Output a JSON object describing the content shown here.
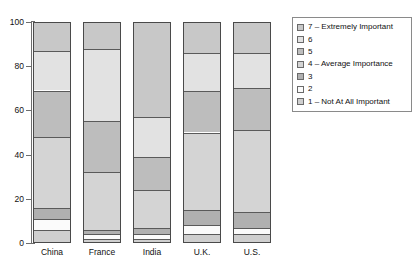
{
  "chart_data": {
    "type": "bar",
    "subtype": "stacked-percentage",
    "title": "",
    "xlabel": "",
    "ylabel": "",
    "ylim": [
      0,
      100
    ],
    "yticks": [
      0,
      20,
      40,
      60,
      80,
      100
    ],
    "ytick_labels": [
      "0",
      "20",
      "40",
      "60",
      "80",
      "100"
    ],
    "grid": false,
    "legend_position": "right",
    "categories": [
      "China",
      "France",
      "India",
      "U.K.",
      "U.S."
    ],
    "series": [
      {
        "name": "7 – Extremely Important",
        "color": "#c8c8c8",
        "values": [
          13,
          12,
          43,
          14,
          14
        ]
      },
      {
        "name": "6",
        "color": "#e2e2e2",
        "values": [
          18,
          33,
          18,
          17,
          16
        ]
      },
      {
        "name": "5",
        "color": "#bdbdbd",
        "values": [
          21,
          23,
          15,
          19,
          19
        ]
      },
      {
        "name": "4 – Average Importance",
        "color": "#d4d4d4",
        "values": [
          32,
          26,
          17,
          35,
          37
        ]
      },
      {
        "name": "3",
        "color": "#b0b0b0",
        "values": [
          5,
          2,
          3,
          7,
          7
        ]
      },
      {
        "name": "2",
        "color": "#fbfbfb",
        "values": [
          5,
          2,
          2,
          4,
          3
        ]
      },
      {
        "name": "1 – Not At All Important",
        "color": "#cfcfcf",
        "values": [
          6,
          2,
          2,
          4,
          4
        ]
      }
    ]
  },
  "axis": {
    "y_ticks": [
      "100",
      "80",
      "60",
      "40",
      "20",
      "0"
    ],
    "x_labels": [
      "China",
      "France",
      "India",
      "U.K.",
      "U.S."
    ]
  },
  "legend": {
    "items": [
      {
        "label": "7 – Extremely Important",
        "color": "#c8c8c8"
      },
      {
        "label": "6",
        "color": "#e2e2e2"
      },
      {
        "label": "5",
        "color": "#bdbdbd"
      },
      {
        "label": "4 – Average Importance",
        "color": "#d4d4d4"
      },
      {
        "label": "3",
        "color": "#b0b0b0"
      },
      {
        "label": "2",
        "color": "#fbfbfb"
      },
      {
        "label": "1 – Not At All Important",
        "color": "#cfcfcf"
      }
    ]
  },
  "captions": {
    "top": "",
    "bottom": ""
  }
}
